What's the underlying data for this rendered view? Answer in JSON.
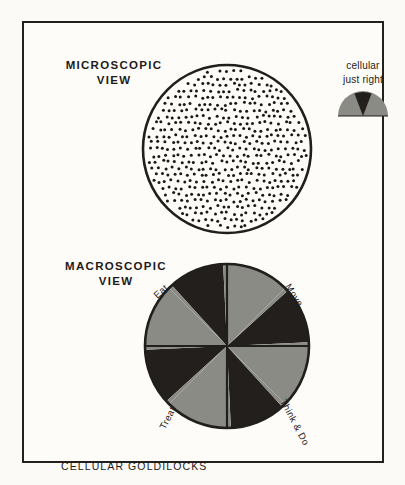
{
  "poster": {
    "caption": "CELLULAR GOLDILOCKS",
    "frame_color": "#23211e",
    "paper_color": "#fdfcf9"
  },
  "microscopic": {
    "heading": "MICROSCOPIC\nVIEW",
    "circle": {
      "icon": "dotted-circle-icon",
      "outline_color": "#211f1c",
      "dot_color": "#1a1917",
      "fill_color": "#fdfcf9",
      "dot_count": 560,
      "dot_radius_px": 1.5
    }
  },
  "gauge": {
    "label_line_1": "cellular",
    "label_line_2": "just right",
    "icon": "gauge-semicircle-icon",
    "dial_color": "#8b8b86",
    "needle_color": "#231f1c",
    "needle_angle_deg": 0,
    "needle_half_width_deg": 21
  },
  "macroscopic": {
    "heading": "MACROSCOPIC\nVIEW",
    "chart_data": {
      "type": "pie",
      "title": "MACROSCOPIC VIEW",
      "categories": [
        "Eat",
        "Move",
        "Think & Do",
        "Treat"
      ],
      "slice_count": 8,
      "slice_values": [
        12.5,
        12.5,
        12.5,
        12.5,
        12.5,
        12.5,
        12.5,
        12.5
      ],
      "slice_colors": [
        "#8b8b86",
        "#231f1c",
        "#8b8b86",
        "#231f1c",
        "#8b8b86",
        "#231f1c",
        "#8b8b86",
        "#231f1c"
      ],
      "grid": true,
      "legend": "none",
      "outline_color": "#211f1c",
      "divider_color": "#211f1c",
      "annotations": [
        {
          "text": "Eat",
          "position": "upper-left",
          "rotation_deg": -42
        },
        {
          "text": "Move",
          "position": "upper-right",
          "rotation_deg": 58
        },
        {
          "text": "Think & Do",
          "position": "lower-right",
          "rotation_deg": 62
        },
        {
          "text": "Treat",
          "position": "lower-left",
          "rotation_deg": -63
        }
      ]
    }
  }
}
